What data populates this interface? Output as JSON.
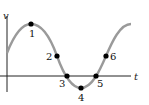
{
  "diagram": {
    "type": "sinusoidal wave graph",
    "axes": {
      "y_label": "v",
      "x_label": "t"
    },
    "curve_color": "#9a9a9a",
    "axis_color": "#222222",
    "point_color": "#000000",
    "points": [
      {
        "label": "1",
        "x": 31,
        "y": 24,
        "lx": 29,
        "ly": 37
      },
      {
        "label": "2",
        "x": 57,
        "y": 56,
        "lx": 46,
        "ly": 60
      },
      {
        "label": "3",
        "x": 67,
        "y": 76,
        "lx": 59,
        "ly": 87
      },
      {
        "label": "4",
        "x": 81,
        "y": 88,
        "lx": 78,
        "ly": 101
      },
      {
        "label": "5",
        "x": 96,
        "y": 76,
        "lx": 97,
        "ly": 87
      },
      {
        "label": "6",
        "x": 106,
        "y": 56,
        "lx": 110,
        "ly": 60
      }
    ]
  }
}
